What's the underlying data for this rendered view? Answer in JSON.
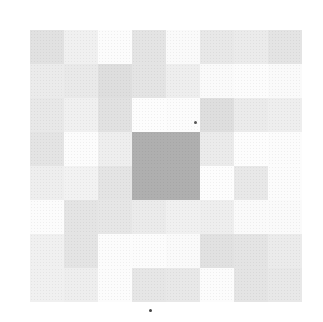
{
  "image": {
    "width": 323,
    "height": 322,
    "background": "#ffffff",
    "grid": {
      "rows": 8,
      "cols": 8,
      "origin": [
        30,
        30
      ],
      "cell_size": 34,
      "values": [
        [
          225,
          240,
          252,
          228,
          250,
          232,
          235,
          228
        ],
        [
          235,
          233,
          222,
          228,
          238,
          250,
          252,
          250
        ],
        [
          232,
          240,
          225,
          253,
          252,
          222,
          235,
          238
        ],
        [
          228,
          252,
          238,
          175,
          175,
          235,
          253,
          252
        ],
        [
          238,
          242,
          228,
          175,
          175,
          253,
          232,
          252
        ],
        [
          252,
          228,
          230,
          235,
          240,
          238,
          250,
          250
        ],
        [
          240,
          228,
          252,
          252,
          250,
          225,
          228,
          235
        ],
        [
          240,
          238,
          252,
          230,
          232,
          252,
          228,
          232
        ]
      ]
    },
    "markers": [
      {
        "name": "marker-dot-1",
        "x": 195,
        "y": 122,
        "color": "#555555"
      },
      {
        "name": "marker-dot-2",
        "x": 150,
        "y": 310,
        "color": "#444444"
      }
    ]
  }
}
